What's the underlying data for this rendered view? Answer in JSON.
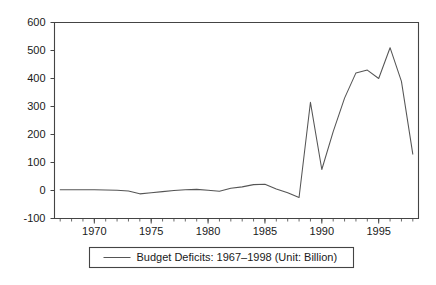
{
  "chart_data": {
    "type": "line",
    "title": "",
    "xlabel": "",
    "ylabel": "",
    "xlim": [
      1966.5,
      1998.5
    ],
    "ylim": [
      -100,
      600
    ],
    "grid": false,
    "legend_position": "below-axes",
    "y_ticks": [
      -100,
      0,
      100,
      200,
      300,
      400,
      500,
      600
    ],
    "y_tick_labels": [
      "-100",
      "0",
      "100",
      "200",
      "300",
      "400",
      "500",
      "600"
    ],
    "x_ticks": [
      1970,
      1975,
      1980,
      1985,
      1990,
      1995
    ],
    "x_tick_labels": [
      "1970",
      "1975",
      "1980",
      "1985",
      "1990",
      "1995"
    ],
    "x_minor_tick_step": 1,
    "series": [
      {
        "name": "Budget Deficits: 1967–1998 (Unit: Billion)",
        "color": "#555555",
        "x": [
          1967,
          1968,
          1969,
          1970,
          1971,
          1972,
          1973,
          1974,
          1975,
          1976,
          1977,
          1978,
          1979,
          1980,
          1981,
          1982,
          1983,
          1984,
          1985,
          1986,
          1987,
          1988,
          1989,
          1990,
          1991,
          1992,
          1993,
          1994,
          1995,
          1996,
          1997,
          1998
        ],
        "values": [
          3,
          3,
          3,
          3,
          2,
          1,
          -2,
          -12,
          -8,
          -4,
          0,
          3,
          4,
          1,
          -3,
          8,
          13,
          21,
          22,
          5,
          -8,
          -25,
          315,
          75,
          210,
          330,
          420,
          430,
          400,
          510,
          390,
          130
        ]
      }
    ],
    "legend_entries": [
      {
        "label": "Budget Deficits: 1967–1998 (Unit: Billion)",
        "color": "#555555",
        "marker": "line"
      }
    ]
  },
  "figure": {
    "background_color": "#ffffff",
    "axes_color": "#444444",
    "text_color": "#1a1a1a"
  }
}
